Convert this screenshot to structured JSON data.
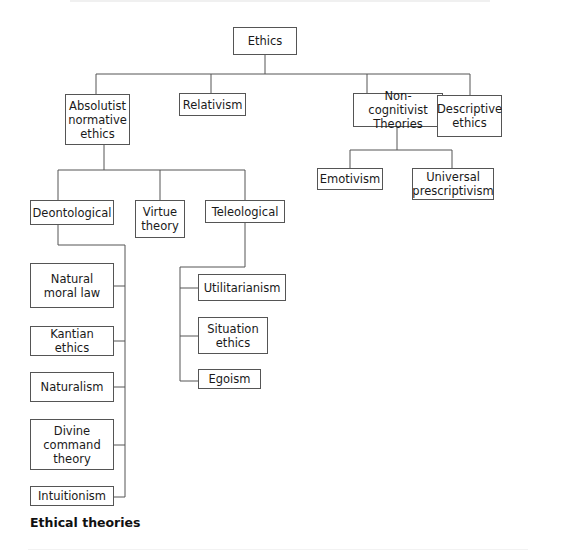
{
  "diagram": {
    "type": "tree",
    "caption": "Ethical theories",
    "line_color": "#555555",
    "nodes": {
      "ethics": "Ethics",
      "absolutist": "Absolutist normative ethics",
      "relativism": "Relativism",
      "noncognitivist": "Non-cognitivist Theories",
      "descriptive": "Descriptive ethics",
      "deontological": "Deontological",
      "virtue": "Virtue theory",
      "teleological": "Teleological",
      "emotivism": "Emotivism",
      "universal": "Universal prescriptivism",
      "natural_moral_law": "Natural moral law",
      "kantian": "Kantian ethics",
      "naturalism": "Naturalism",
      "divine_command": "Divine command theory",
      "intuitionism": "Intuitionism",
      "utilitarianism": "Utilitarianism",
      "situation": "Situation ethics",
      "egoism": "Egoism"
    },
    "edges": [
      [
        "ethics",
        "absolutist"
      ],
      [
        "ethics",
        "relativism"
      ],
      [
        "ethics",
        "noncognitivist"
      ],
      [
        "ethics",
        "descriptive"
      ],
      [
        "absolutist",
        "deontological"
      ],
      [
        "absolutist",
        "virtue"
      ],
      [
        "absolutist",
        "teleological"
      ],
      [
        "noncognitivist",
        "emotivism"
      ],
      [
        "noncognitivist",
        "universal"
      ],
      [
        "deontological",
        "natural_moral_law"
      ],
      [
        "deontological",
        "kantian"
      ],
      [
        "deontological",
        "naturalism"
      ],
      [
        "deontological",
        "divine_command"
      ],
      [
        "deontological",
        "intuitionism"
      ],
      [
        "teleological",
        "utilitarianism"
      ],
      [
        "teleological",
        "situation"
      ],
      [
        "teleological",
        "egoism"
      ]
    ]
  }
}
